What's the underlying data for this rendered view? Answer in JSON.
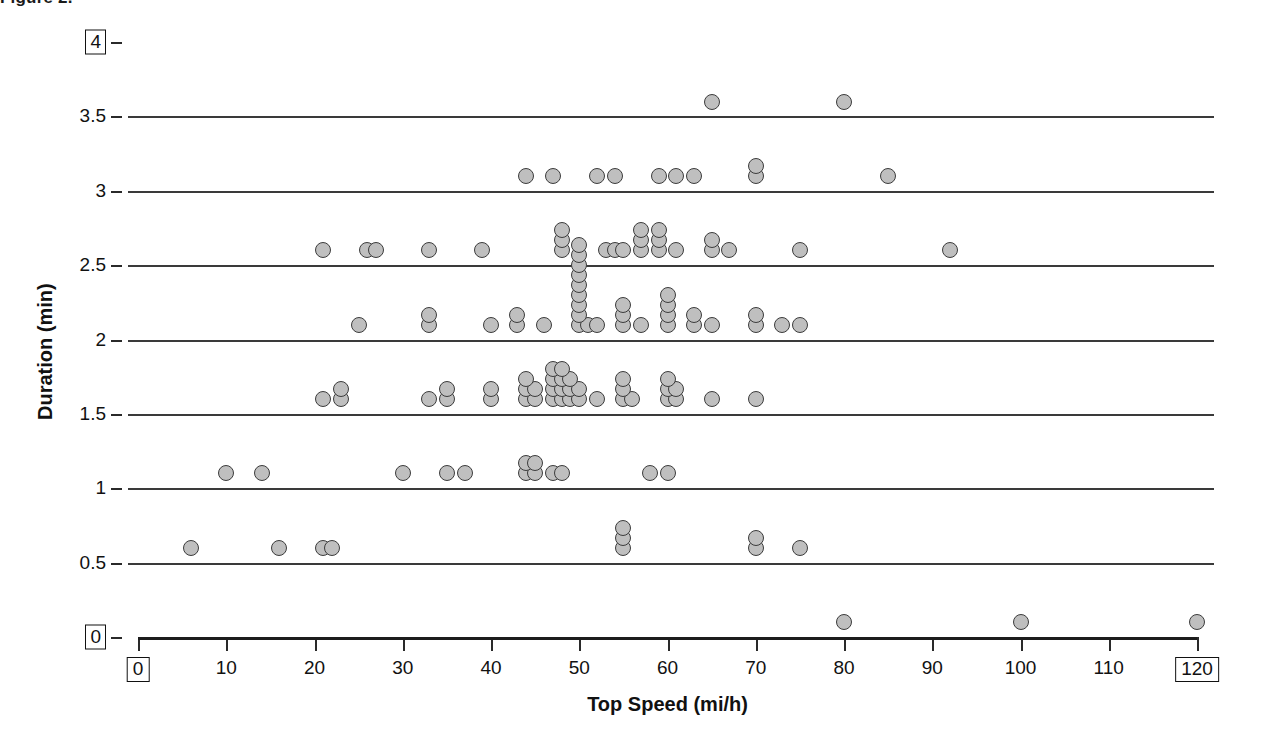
{
  "caption": "Figure 2.",
  "axis_title_y": "Duration (min)",
  "axis_title_x": "Top Speed (mi/h)",
  "yticks": [
    {
      "value": 0,
      "label": "0",
      "boxed": true,
      "gridline": false
    },
    {
      "value": 0.5,
      "label": "0.5",
      "boxed": false,
      "gridline": true
    },
    {
      "value": 1,
      "label": "1",
      "boxed": false,
      "gridline": true
    },
    {
      "value": 1.5,
      "label": "1.5",
      "boxed": false,
      "gridline": true
    },
    {
      "value": 2,
      "label": "2",
      "boxed": false,
      "gridline": true
    },
    {
      "value": 2.5,
      "label": "2.5",
      "boxed": false,
      "gridline": true
    },
    {
      "value": 3,
      "label": "3",
      "boxed": false,
      "gridline": true
    },
    {
      "value": 3.5,
      "label": "3.5",
      "boxed": false,
      "gridline": true
    },
    {
      "value": 4,
      "label": "4",
      "boxed": true,
      "gridline": false
    }
  ],
  "xticks": [
    {
      "value": 0,
      "label": "0",
      "boxed": true
    },
    {
      "value": 10,
      "label": "10",
      "boxed": false
    },
    {
      "value": 20,
      "label": "20",
      "boxed": false
    },
    {
      "value": 30,
      "label": "30",
      "boxed": false
    },
    {
      "value": 40,
      "label": "40",
      "boxed": false
    },
    {
      "value": 50,
      "label": "50",
      "boxed": false
    },
    {
      "value": 60,
      "label": "60",
      "boxed": false
    },
    {
      "value": 70,
      "label": "70",
      "boxed": false
    },
    {
      "value": 80,
      "label": "80",
      "boxed": false
    },
    {
      "value": 90,
      "label": "90",
      "boxed": false
    },
    {
      "value": 100,
      "label": "100",
      "boxed": false
    },
    {
      "value": 110,
      "label": "110",
      "boxed": false
    },
    {
      "value": 120,
      "label": "120",
      "boxed": true
    }
  ],
  "marker": {
    "fill": "#bfbfbf",
    "stroke": "#3c3c3c",
    "size_px": 16
  },
  "chart_data": {
    "type": "scatter",
    "title": "Figure 2.",
    "xlabel": "Top Speed (mi/h)",
    "ylabel": "Duration (min)",
    "xlim": [
      0,
      120
    ],
    "ylim": [
      0,
      4
    ],
    "grid": true,
    "legend": null,
    "stack_offset_min": 0.048,
    "points": [
      {
        "x": 6,
        "y": 0.6,
        "n": 1
      },
      {
        "x": 16,
        "y": 0.6,
        "n": 1
      },
      {
        "x": 21,
        "y": 0.6,
        "n": 1
      },
      {
        "x": 22,
        "y": 0.6,
        "n": 1
      },
      {
        "x": 55,
        "y": 0.6,
        "n": 3
      },
      {
        "x": 70,
        "y": 0.6,
        "n": 2
      },
      {
        "x": 75,
        "y": 0.6,
        "n": 1
      },
      {
        "x": 10,
        "y": 1.1,
        "n": 1
      },
      {
        "x": 14,
        "y": 1.1,
        "n": 1
      },
      {
        "x": 30,
        "y": 1.1,
        "n": 1
      },
      {
        "x": 35,
        "y": 1.1,
        "n": 1
      },
      {
        "x": 37,
        "y": 1.1,
        "n": 1
      },
      {
        "x": 44,
        "y": 1.1,
        "n": 2
      },
      {
        "x": 45,
        "y": 1.1,
        "n": 2
      },
      {
        "x": 47,
        "y": 1.1,
        "n": 1
      },
      {
        "x": 48,
        "y": 1.1,
        "n": 1
      },
      {
        "x": 58,
        "y": 1.1,
        "n": 1
      },
      {
        "x": 60,
        "y": 1.1,
        "n": 1
      },
      {
        "x": 21,
        "y": 1.6,
        "n": 1
      },
      {
        "x": 23,
        "y": 1.6,
        "n": 2
      },
      {
        "x": 33,
        "y": 1.6,
        "n": 1
      },
      {
        "x": 35,
        "y": 1.6,
        "n": 2
      },
      {
        "x": 40,
        "y": 1.6,
        "n": 2
      },
      {
        "x": 44,
        "y": 1.6,
        "n": 3
      },
      {
        "x": 45,
        "y": 1.6,
        "n": 2
      },
      {
        "x": 47,
        "y": 1.6,
        "n": 4
      },
      {
        "x": 48,
        "y": 1.6,
        "n": 4
      },
      {
        "x": 49,
        "y": 1.6,
        "n": 3
      },
      {
        "x": 50,
        "y": 1.6,
        "n": 2
      },
      {
        "x": 52,
        "y": 1.6,
        "n": 1
      },
      {
        "x": 55,
        "y": 1.6,
        "n": 3
      },
      {
        "x": 56,
        "y": 1.6,
        "n": 1
      },
      {
        "x": 60,
        "y": 1.6,
        "n": 3
      },
      {
        "x": 61,
        "y": 1.6,
        "n": 2
      },
      {
        "x": 65,
        "y": 1.6,
        "n": 1
      },
      {
        "x": 70,
        "y": 1.6,
        "n": 1
      },
      {
        "x": 25,
        "y": 2.1,
        "n": 1
      },
      {
        "x": 33,
        "y": 2.1,
        "n": 2
      },
      {
        "x": 40,
        "y": 2.1,
        "n": 1
      },
      {
        "x": 43,
        "y": 2.1,
        "n": 2
      },
      {
        "x": 46,
        "y": 2.1,
        "n": 1
      },
      {
        "x": 50,
        "y": 2.1,
        "n": 9
      },
      {
        "x": 51,
        "y": 2.1,
        "n": 1
      },
      {
        "x": 52,
        "y": 2.1,
        "n": 1
      },
      {
        "x": 55,
        "y": 2.1,
        "n": 3
      },
      {
        "x": 57,
        "y": 2.1,
        "n": 1
      },
      {
        "x": 60,
        "y": 2.1,
        "n": 4
      },
      {
        "x": 63,
        "y": 2.1,
        "n": 2
      },
      {
        "x": 65,
        "y": 2.1,
        "n": 1
      },
      {
        "x": 70,
        "y": 2.1,
        "n": 2
      },
      {
        "x": 73,
        "y": 2.1,
        "n": 1
      },
      {
        "x": 75,
        "y": 2.1,
        "n": 1
      },
      {
        "x": 21,
        "y": 2.6,
        "n": 1
      },
      {
        "x": 26,
        "y": 2.6,
        "n": 1
      },
      {
        "x": 27,
        "y": 2.6,
        "n": 1
      },
      {
        "x": 33,
        "y": 2.6,
        "n": 1
      },
      {
        "x": 39,
        "y": 2.6,
        "n": 1
      },
      {
        "x": 48,
        "y": 2.6,
        "n": 3
      },
      {
        "x": 53,
        "y": 2.6,
        "n": 1
      },
      {
        "x": 54,
        "y": 2.6,
        "n": 1
      },
      {
        "x": 55,
        "y": 2.6,
        "n": 1
      },
      {
        "x": 57,
        "y": 2.6,
        "n": 3
      },
      {
        "x": 59,
        "y": 2.6,
        "n": 3
      },
      {
        "x": 61,
        "y": 2.6,
        "n": 1
      },
      {
        "x": 65,
        "y": 2.6,
        "n": 2
      },
      {
        "x": 67,
        "y": 2.6,
        "n": 1
      },
      {
        "x": 75,
        "y": 2.6,
        "n": 1
      },
      {
        "x": 92,
        "y": 2.6,
        "n": 1
      },
      {
        "x": 44,
        "y": 3.1,
        "n": 1
      },
      {
        "x": 47,
        "y": 3.1,
        "n": 1
      },
      {
        "x": 52,
        "y": 3.1,
        "n": 1
      },
      {
        "x": 54,
        "y": 3.1,
        "n": 1
      },
      {
        "x": 59,
        "y": 3.1,
        "n": 1
      },
      {
        "x": 61,
        "y": 3.1,
        "n": 1
      },
      {
        "x": 63,
        "y": 3.1,
        "n": 1
      },
      {
        "x": 70,
        "y": 3.1,
        "n": 2
      },
      {
        "x": 85,
        "y": 3.1,
        "n": 1
      },
      {
        "x": 65,
        "y": 3.6,
        "n": 1
      },
      {
        "x": 80,
        "y": 3.6,
        "n": 1
      },
      {
        "x": 80,
        "y": 0.1,
        "n": 1
      },
      {
        "x": 100,
        "y": 0.1,
        "n": 1
      },
      {
        "x": 120,
        "y": 0.1,
        "n": 1
      }
    ]
  }
}
